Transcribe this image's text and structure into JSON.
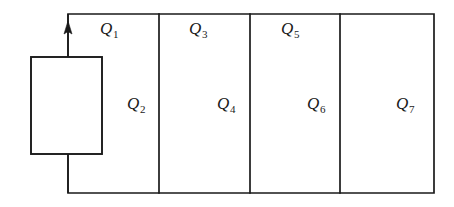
{
  "figure": {
    "type": "circuit-loop-diagram",
    "background_color": "#ffffff",
    "line_color": "#1a1a1a",
    "width": 454,
    "height": 207
  },
  "source": {
    "name": "source-element",
    "shape": "rectangle",
    "x": 31,
    "y": 57,
    "width": 71,
    "height": 97
  },
  "current_arrow": {
    "name": "current-direction-arrow",
    "direction": "up",
    "x": 68,
    "y": 25
  },
  "loop": {
    "x": 68,
    "y": 14,
    "width": 366,
    "height": 179,
    "dividers_x": [
      159,
      250,
      340
    ]
  },
  "labels": [
    {
      "symbol": "Q",
      "subscript": "1",
      "x": 100,
      "y": 20,
      "row": "top",
      "cell": 1
    },
    {
      "symbol": "Q",
      "subscript": "2",
      "x": 127,
      "y": 95,
      "row": "middle",
      "cell": 1
    },
    {
      "symbol": "Q",
      "subscript": "3",
      "x": 189,
      "y": 20,
      "row": "top",
      "cell": 2
    },
    {
      "symbol": "Q",
      "subscript": "4",
      "x": 217,
      "y": 95,
      "row": "middle",
      "cell": 2
    },
    {
      "symbol": "Q",
      "subscript": "5",
      "x": 281,
      "y": 20,
      "row": "top",
      "cell": 3
    },
    {
      "symbol": "Q",
      "subscript": "6",
      "x": 307,
      "y": 95,
      "row": "middle",
      "cell": 3
    },
    {
      "symbol": "Q",
      "subscript": "7",
      "x": 396,
      "y": 95,
      "row": "middle",
      "cell": 4
    }
  ]
}
